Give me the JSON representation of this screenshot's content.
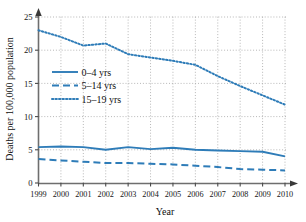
{
  "chart_data": {
    "type": "line",
    "title": "",
    "xlabel": "Year",
    "ylabel": "Deaths per 100,000 population",
    "x": [
      1999,
      2000,
      2001,
      2002,
      2003,
      2004,
      2005,
      2006,
      2007,
      2008,
      2009,
      2010
    ],
    "categories": [
      "1999",
      "2000",
      "2001",
      "2002",
      "2003",
      "2004",
      "2005",
      "2006",
      "2007",
      "2008",
      "2009",
      "2010"
    ],
    "xlim": [
      1999,
      2010
    ],
    "ylim": [
      0,
      25
    ],
    "yticks": [
      0,
      5,
      10,
      15,
      20,
      25
    ],
    "ytick_labels": [
      "0",
      "5",
      "10",
      "15",
      "20",
      "25"
    ],
    "grid": true,
    "grid_style": "dotted",
    "legend_position": "upper-left-inside",
    "accent_color": "#2E7CB8",
    "series": [
      {
        "name": "0–4 yrs",
        "style": "solid",
        "color": "#2E7CB8",
        "values": [
          5.4,
          5.5,
          5.4,
          5.0,
          5.4,
          5.1,
          5.3,
          5.0,
          4.9,
          4.8,
          4.7,
          4.0
        ]
      },
      {
        "name": "5–14 yrs",
        "style": "dashed",
        "color": "#2E7CB8",
        "values": [
          3.6,
          3.4,
          3.2,
          3.0,
          3.0,
          2.9,
          2.8,
          2.6,
          2.4,
          2.1,
          2.0,
          1.9
        ]
      },
      {
        "name": "15–19 yrs",
        "style": "dotted",
        "color": "#2E7CB8",
        "values": [
          23.0,
          22.0,
          20.7,
          21.0,
          19.4,
          18.9,
          18.4,
          17.8,
          16.1,
          14.6,
          13.2,
          11.8
        ]
      }
    ]
  },
  "legend": {
    "items": [
      {
        "label": "0–4 yrs",
        "style": "solid"
      },
      {
        "label": "5–14 yrs",
        "style": "dashed"
      },
      {
        "label": "15–19 yrs",
        "style": "dotted"
      }
    ]
  },
  "axes": {
    "x_title": "Year",
    "y_title": "Deaths per 100,000 population"
  }
}
